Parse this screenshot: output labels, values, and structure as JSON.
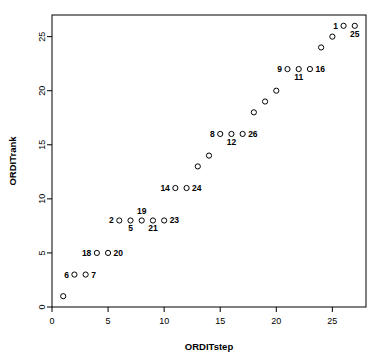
{
  "chart_data": {
    "type": "scatter",
    "title": "",
    "xlabel": "ORDITstep",
    "ylabel": "ORDITrank",
    "xlim": [
      0,
      28
    ],
    "ylim": [
      0,
      27
    ],
    "xticks": [
      0,
      5,
      10,
      15,
      20,
      25
    ],
    "yticks": [
      0,
      5,
      10,
      15,
      20,
      25
    ],
    "xtick_labels": [
      "0",
      "5",
      "10",
      "15",
      "20",
      "25"
    ],
    "ytick_labels": [
      "0",
      "5",
      "10",
      "15",
      "20",
      "25"
    ],
    "grid": false,
    "legend": false,
    "marker": "open-circle",
    "points": [
      {
        "x": 1,
        "y": 1,
        "label": "",
        "pos": ""
      },
      {
        "x": 2,
        "y": 3,
        "label": "6",
        "pos": "left"
      },
      {
        "x": 3,
        "y": 3,
        "label": "7",
        "pos": "right"
      },
      {
        "x": 4,
        "y": 5,
        "label": "18",
        "pos": "left"
      },
      {
        "x": 5,
        "y": 5,
        "label": "20",
        "pos": "right"
      },
      {
        "x": 6,
        "y": 8,
        "label": "2",
        "pos": "left"
      },
      {
        "x": 7,
        "y": 8,
        "label": "5",
        "pos": "below"
      },
      {
        "x": 8,
        "y": 8,
        "label": "19",
        "pos": "above"
      },
      {
        "x": 9,
        "y": 8,
        "label": "21",
        "pos": "below"
      },
      {
        "x": 10,
        "y": 8,
        "label": "23",
        "pos": "right"
      },
      {
        "x": 11,
        "y": 11,
        "label": "14",
        "pos": "left"
      },
      {
        "x": 12,
        "y": 11,
        "label": "24",
        "pos": "right"
      },
      {
        "x": 13,
        "y": 13,
        "label": "",
        "pos": ""
      },
      {
        "x": 14,
        "y": 14,
        "label": "",
        "pos": ""
      },
      {
        "x": 15,
        "y": 16,
        "label": "8",
        "pos": "left"
      },
      {
        "x": 16,
        "y": 16,
        "label": "12",
        "pos": "below"
      },
      {
        "x": 17,
        "y": 16,
        "label": "26",
        "pos": "right"
      },
      {
        "x": 18,
        "y": 18,
        "label": "",
        "pos": ""
      },
      {
        "x": 19,
        "y": 19,
        "label": "",
        "pos": ""
      },
      {
        "x": 20,
        "y": 20,
        "label": "",
        "pos": ""
      },
      {
        "x": 21,
        "y": 22,
        "label": "9",
        "pos": "left"
      },
      {
        "x": 22,
        "y": 22,
        "label": "11",
        "pos": "below"
      },
      {
        "x": 23,
        "y": 22,
        "label": "16",
        "pos": "right"
      },
      {
        "x": 24,
        "y": 24,
        "label": "",
        "pos": ""
      },
      {
        "x": 25,
        "y": 25,
        "label": "",
        "pos": ""
      },
      {
        "x": 26,
        "y": 26,
        "label": "1",
        "pos": "left"
      },
      {
        "x": 27,
        "y": 26,
        "label": "25",
        "pos": "below"
      }
    ],
    "colors": {
      "marker_stroke": "#000000",
      "axis": "#000000",
      "background": "#ffffff",
      "label_text": "#000000"
    }
  }
}
